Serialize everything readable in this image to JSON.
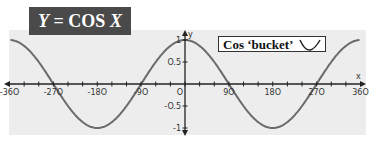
{
  "title": {
    "prefix": "Y",
    "eq": " = COS ",
    "var": "X"
  },
  "legend": {
    "label": "Cos ‘bucket’",
    "icon": "bucket-curve-icon"
  },
  "colors": {
    "curve": "#6b6b6b",
    "axis": "#222222",
    "panel": "#ededed",
    "title_bg": "#4a4a4a"
  },
  "chart_data": {
    "type": "line",
    "title": "Y = COS X",
    "xlabel": "x",
    "ylabel": "y",
    "x_ticks": [
      -360,
      -270,
      -180,
      -90,
      0,
      90,
      180,
      270,
      360
    ],
    "y_ticks": [
      1,
      0.5,
      -0.5,
      -1
    ],
    "xlim": [
      -360,
      360
    ],
    "ylim": [
      -1,
      1
    ],
    "series": [
      {
        "name": "y = cos x",
        "x": [
          -360,
          -270,
          -180,
          -90,
          0,
          90,
          180,
          270,
          360
        ],
        "values": [
          1,
          0,
          -1,
          0,
          1,
          0,
          -1,
          0,
          1
        ]
      }
    ],
    "annotations": [
      "Cos ‘bucket’"
    ],
    "grid": false
  }
}
